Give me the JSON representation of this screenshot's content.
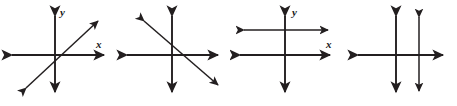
{
  "figure": {
    "width": 457,
    "height": 106,
    "background_color": "#ffffff",
    "stroke_color": "#231f20",
    "axis_label_x": "x",
    "axis_label_y": "y"
  },
  "panels": [
    {
      "id": "panel-1",
      "name": "intersecting-lines-positive-slope",
      "description": "Coordinate axes with one slanted line of positive slope crossing the axes; lines intersect at one point.",
      "label_x": "x",
      "label_y": "y",
      "x_axis": {
        "x1": 8,
        "y1": 55,
        "x2": 108,
        "y2": 55
      },
      "y_axis": {
        "x1": 55,
        "y1": 12,
        "x2": 55,
        "y2": 96
      },
      "lines": [
        {
          "name": "line-positive-slope",
          "x1": 22,
          "y1": 92,
          "x2": 102,
          "y2": 17
        }
      ],
      "label_x_pos": {
        "left": 96,
        "top": 39
      },
      "label_y_pos": {
        "left": 60,
        "top": 7
      }
    },
    {
      "id": "panel-2",
      "name": "intersecting-lines-negative-slope",
      "description": "Coordinate axes with one slanted line of negative slope crossing the axes; lines intersect at one point.",
      "label_x": "x",
      "label_y": "y",
      "x_axis": {
        "x1": 123,
        "y1": 55,
        "x2": 222,
        "y2": 55
      },
      "y_axis": {
        "x1": 172,
        "y1": 12,
        "x2": 172,
        "y2": 96
      },
      "lines": [
        {
          "name": "line-negative-slope",
          "x1": 140,
          "y1": 17,
          "x2": 222,
          "y2": 89
        }
      ],
      "label_x_pos": {
        "left": 211,
        "top": 39
      },
      "label_y_pos": {
        "left": 177,
        "top": 7
      }
    },
    {
      "id": "panel-3",
      "name": "parallel-horizontal-lines",
      "description": "Coordinate axes with a second horizontal line above the x-axis; the two horizontal lines are parallel and never meet.",
      "label_x": "x",
      "label_y": "y",
      "x_axis": {
        "x1": 236,
        "y1": 55,
        "x2": 334,
        "y2": 55
      },
      "y_axis": {
        "x1": 285,
        "y1": 12,
        "x2": 285,
        "y2": 96
      },
      "lines": [
        {
          "name": "line-horizontal-parallel",
          "x1": 240,
          "y1": 30,
          "x2": 332,
          "y2": 30
        }
      ],
      "label_x_pos": {
        "left": 322,
        "top": 39
      },
      "label_y_pos": {
        "left": 290,
        "top": 7
      }
    },
    {
      "id": "panel-4",
      "name": "parallel-vertical-lines",
      "description": "Coordinate axes with a second vertical line right of the y-axis; the two vertical lines are parallel and never meet.",
      "label_x": "x",
      "label_y": "y",
      "x_axis": {
        "x1": 354,
        "y1": 55,
        "x2": 447,
        "y2": 55
      },
      "y_axis": {
        "x1": 396,
        "y1": 12,
        "x2": 396,
        "y2": 96
      },
      "lines": [
        {
          "name": "line-vertical-parallel",
          "x1": 419,
          "y1": 13,
          "x2": 419,
          "y2": 95
        }
      ],
      "label_x_pos": {
        "left": 434,
        "top": 39
      },
      "label_y_pos": {
        "left": 401,
        "top": 7
      }
    }
  ]
}
